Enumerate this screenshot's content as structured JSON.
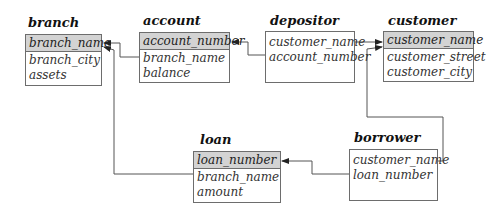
{
  "diagram": {
    "type": "relational-schema",
    "tables": [
      {
        "name": "branch",
        "primary_key": "branch_name",
        "attributes": [
          "branch_city",
          "assets"
        ]
      },
      {
        "name": "account",
        "primary_key": "account_number",
        "attributes": [
          "branch_name",
          "balance"
        ]
      },
      {
        "name": "depositor",
        "primary_key": null,
        "attributes": [
          "customer_name",
          "account_number"
        ]
      },
      {
        "name": "customer",
        "primary_key": "customer_name",
        "attributes": [
          "customer_street",
          "customer_city"
        ]
      },
      {
        "name": "loan",
        "primary_key": "loan_number",
        "attributes": [
          "branch_name",
          "amount"
        ]
      },
      {
        "name": "borrower",
        "primary_key": null,
        "attributes": [
          "customer_name",
          "loan_number"
        ]
      }
    ],
    "foreign_keys": [
      {
        "from": "account.branch_name",
        "to": "branch.branch_name"
      },
      {
        "from": "loan.branch_name",
        "to": "branch.branch_name"
      },
      {
        "from": "depositor.account_number",
        "to": "account.account_number"
      },
      {
        "from": "depositor.customer_name",
        "to": "customer.customer_name"
      },
      {
        "from": "borrower.customer_name",
        "to": "customer.customer_name"
      },
      {
        "from": "borrower.loan_number",
        "to": "loan.loan_number"
      }
    ],
    "colors": {
      "key_header": "#d3d3d3",
      "border": "#6d6d6d",
      "line": "#555555"
    }
  }
}
